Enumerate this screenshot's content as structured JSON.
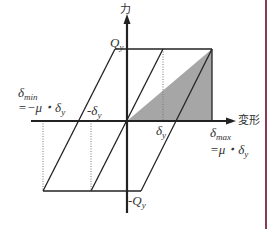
{
  "diagram": {
    "axes": {
      "y_label": "力",
      "x_label": "変形"
    },
    "labels": {
      "qy": "Q",
      "qy_sub": "y",
      "neg_qy": "-Q",
      "neg_qy_sub": "y",
      "delta_y": "δ",
      "delta_y_sub": "y",
      "neg_delta_y": "-δ",
      "neg_delta_y_sub": "y",
      "delta_min": "δ",
      "delta_min_sub": "min",
      "delta_min_eq": "=−μ・δ",
      "delta_min_eq_sub": "y",
      "delta_max": "δ",
      "delta_max_sub": "max",
      "delta_max_eq": "=μ・δ",
      "delta_max_eq_sub": "y"
    },
    "colors": {
      "line": "#222222",
      "shade": "#a6a6a6",
      "border": "#8a3a55"
    }
  }
}
